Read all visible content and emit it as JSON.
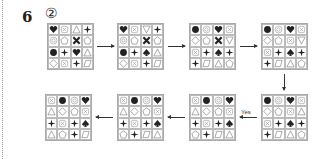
{
  "question": {
    "number": "6",
    "answer_marker": "②"
  },
  "labels": {
    "yes": "Yes"
  },
  "colors": {
    "ink": "#222222",
    "grid_line": "#bbbbbb",
    "outline": "#888888"
  },
  "grids": [
    {
      "id": 1,
      "x": 47,
      "y": 23,
      "cells": [
        [
          "heart",
          "xbox",
          "triangle",
          "plus"
        ],
        [
          "gear",
          "pentagon",
          "cross",
          "pentagon"
        ],
        [
          "circle",
          "plus",
          "heart",
          "triangle"
        ],
        [
          "diamond",
          "xbox",
          "plus",
          "parallelogram"
        ]
      ]
    },
    {
      "id": 2,
      "x": 117,
      "y": 23,
      "cells": [
        [
          "heart",
          "xbox",
          "inv-triangle",
          "plus"
        ],
        [
          "gear",
          "pentagon",
          "cross",
          "pentagon"
        ],
        [
          "circle",
          "plus",
          "spade",
          "triangle"
        ],
        [
          "diamond",
          "xbox",
          "plus",
          "parallelogram"
        ]
      ]
    },
    {
      "id": 3,
      "x": 189,
      "y": 23,
      "cells": [
        [
          "circle",
          "gear",
          "heart",
          "xbox"
        ],
        [
          "diamond",
          "pentagon",
          "cross",
          "inv-triangle"
        ],
        [
          "xbox",
          "plus",
          "spade",
          "plus"
        ],
        [
          "plus",
          "parallelogram",
          "triangle",
          "pentagon"
        ]
      ]
    },
    {
      "id": 4,
      "x": 261,
      "y": 23,
      "cells": [
        [
          "circle",
          "gear",
          "heart",
          "xbox"
        ],
        [
          "diamond",
          "pentagon",
          "xbox",
          "inv-triangle"
        ],
        [
          "xbox",
          "plus",
          "spade",
          "plus"
        ],
        [
          "plus",
          "parallelogram",
          "triangle",
          "pentagon"
        ]
      ]
    },
    {
      "id": 5,
      "x": 261,
      "y": 94,
      "cells": [
        [
          "circle",
          "gear",
          "heart",
          "xbox"
        ],
        [
          "diamond",
          "pentagon",
          "xbox",
          "triangle"
        ],
        [
          "xbox",
          "plus",
          "spade",
          "plus"
        ],
        [
          "plus",
          "parallelogram",
          "triangle",
          "pentagon"
        ]
      ]
    },
    {
      "id": 6,
      "x": 189,
      "y": 94,
      "cells": [
        [
          "xbox",
          "circle",
          "gear",
          "heart"
        ],
        [
          "triangle",
          "diamond",
          "pentagon",
          "xbox"
        ],
        [
          "plus",
          "xbox",
          "plus",
          "spade"
        ],
        [
          "pentagon",
          "plus",
          "parallelogram",
          "triangle"
        ]
      ]
    },
    {
      "id": 7,
      "x": 117,
      "y": 94,
      "cells": [
        [
          "xbox",
          "circle",
          "gear",
          "heart"
        ],
        [
          "triangle",
          "diamond",
          "pentagon",
          "xbox"
        ],
        [
          "plus",
          "xbox",
          "plus",
          "spade"
        ],
        [
          "pentagon",
          "plus",
          "parallelogram",
          "triangle"
        ]
      ]
    },
    {
      "id": 8,
      "x": 45,
      "y": 94,
      "cells": [
        [
          "xbox",
          "circle",
          "gear",
          "heart"
        ],
        [
          "triangle",
          "diamond",
          "pentagon",
          "xbox"
        ],
        [
          "plus",
          "xbox",
          "plus",
          "spade"
        ],
        [
          "triangle",
          "pentagon",
          "plus",
          "parallelogram"
        ]
      ]
    }
  ],
  "arrows": [
    {
      "dir": "r",
      "x": 97,
      "y": 46,
      "len": 17
    },
    {
      "dir": "r",
      "x": 168,
      "y": 46,
      "len": 17
    },
    {
      "dir": "r",
      "x": 240,
      "y": 46,
      "len": 17
    },
    {
      "dir": "d",
      "x": 284,
      "y": 74,
      "len": 16
    },
    {
      "dir": "l",
      "x": 240,
      "y": 117,
      "len": 17,
      "label": "Yes"
    },
    {
      "dir": "l",
      "x": 168,
      "y": 117,
      "len": 17
    },
    {
      "dir": "l",
      "x": 96,
      "y": 117,
      "len": 17
    }
  ]
}
